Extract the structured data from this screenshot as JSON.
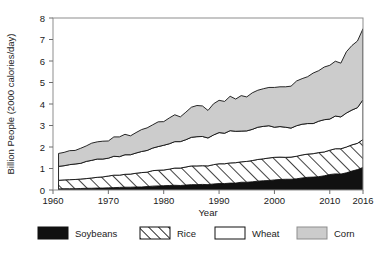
{
  "chart_data": {
    "type": "area",
    "title": "",
    "subtitle": "",
    "xlabel": "Year",
    "ylabel": "Billion People (2000 calories/day)",
    "stacked": true,
    "xlim": [
      1960,
      2016
    ],
    "ylim": [
      0,
      8
    ],
    "xticks": [
      1960,
      1970,
      1980,
      1990,
      2000,
      2010,
      2016
    ],
    "xtick_labels": [
      "1960",
      "1970",
      "1980",
      "1990",
      "2000",
      "2010",
      "2016"
    ],
    "yticks": [
      0,
      1,
      2,
      3,
      4,
      5,
      6,
      7,
      8
    ],
    "ytick_labels": [
      "0",
      "1",
      "2",
      "3",
      "4",
      "5",
      "6",
      "7",
      "8"
    ],
    "grid": false,
    "legend_position": "bottom",
    "legend": [
      "Soybeans",
      "Rice",
      "Wheat",
      "Corn"
    ],
    "colors": {
      "soybeans": "#111111",
      "rice": "#ffffff",
      "rice_hatch": "#111111",
      "wheat": "#ffffff",
      "corn": "#cccccc",
      "outline": "#111111",
      "frame": "#8d8d8d",
      "background": "#ffffff"
    },
    "x": [
      1961,
      1962,
      1963,
      1964,
      1965,
      1966,
      1967,
      1968,
      1969,
      1970,
      1971,
      1972,
      1973,
      1974,
      1975,
      1976,
      1977,
      1978,
      1979,
      1980,
      1981,
      1982,
      1983,
      1984,
      1985,
      1986,
      1987,
      1988,
      1989,
      1990,
      1991,
      1992,
      1993,
      1994,
      1995,
      1996,
      1997,
      1998,
      1999,
      2000,
      2001,
      2002,
      2003,
      2004,
      2005,
      2006,
      2007,
      2008,
      2009,
      2010,
      2011,
      2012,
      2013,
      2014,
      2015,
      2016
    ],
    "series": [
      {
        "name": "Soybeans",
        "values": [
          0.05,
          0.06,
          0.06,
          0.06,
          0.07,
          0.08,
          0.08,
          0.09,
          0.09,
          0.1,
          0.11,
          0.12,
          0.13,
          0.13,
          0.14,
          0.14,
          0.16,
          0.18,
          0.19,
          0.2,
          0.21,
          0.22,
          0.21,
          0.23,
          0.25,
          0.25,
          0.26,
          0.25,
          0.28,
          0.3,
          0.3,
          0.32,
          0.32,
          0.36,
          0.36,
          0.38,
          0.41,
          0.43,
          0.44,
          0.47,
          0.49,
          0.5,
          0.5,
          0.52,
          0.56,
          0.59,
          0.6,
          0.62,
          0.66,
          0.72,
          0.75,
          0.74,
          0.8,
          0.88,
          0.95,
          1.05
        ]
      },
      {
        "name": "Rice",
        "values": [
          0.4,
          0.41,
          0.42,
          0.43,
          0.44,
          0.45,
          0.48,
          0.5,
          0.52,
          0.55,
          0.58,
          0.57,
          0.6,
          0.61,
          0.64,
          0.67,
          0.67,
          0.72,
          0.73,
          0.73,
          0.76,
          0.8,
          0.81,
          0.84,
          0.87,
          0.87,
          0.87,
          0.87,
          0.9,
          0.92,
          0.92,
          0.94,
          0.95,
          0.95,
          0.97,
          0.99,
          1.01,
          1.02,
          1.05,
          1.05,
          1.04,
          1.02,
          1.03,
          1.05,
          1.07,
          1.08,
          1.09,
          1.12,
          1.11,
          1.13,
          1.17,
          1.18,
          1.2,
          1.22,
          1.22,
          1.3
        ]
      },
      {
        "name": "Wheat",
        "values": [
          0.65,
          0.66,
          0.7,
          0.72,
          0.73,
          0.8,
          0.82,
          0.85,
          0.83,
          0.83,
          0.88,
          0.86,
          0.91,
          0.9,
          0.94,
          0.98,
          1.01,
          1.05,
          1.1,
          1.15,
          1.18,
          1.23,
          1.23,
          1.27,
          1.33,
          1.36,
          1.36,
          1.3,
          1.38,
          1.45,
          1.42,
          1.5,
          1.46,
          1.43,
          1.42,
          1.45,
          1.5,
          1.51,
          1.5,
          1.4,
          1.42,
          1.4,
          1.35,
          1.42,
          1.43,
          1.42,
          1.4,
          1.46,
          1.5,
          1.45,
          1.52,
          1.48,
          1.58,
          1.62,
          1.66,
          1.85
        ]
      },
      {
        "name": "Corn",
        "values": [
          0.6,
          0.62,
          0.65,
          0.63,
          0.7,
          0.72,
          0.8,
          0.8,
          0.83,
          0.8,
          0.9,
          0.92,
          0.95,
          0.88,
          0.95,
          1.02,
          1.05,
          1.08,
          1.15,
          1.1,
          1.2,
          1.25,
          1.15,
          1.28,
          1.4,
          1.45,
          1.42,
          1.28,
          1.45,
          1.5,
          1.48,
          1.6,
          1.5,
          1.65,
          1.58,
          1.7,
          1.72,
          1.75,
          1.78,
          1.85,
          1.85,
          1.88,
          1.95,
          2.08,
          2.12,
          2.18,
          2.35,
          2.35,
          2.45,
          2.5,
          2.55,
          2.5,
          2.85,
          3.0,
          3.1,
          3.3
        ]
      }
    ],
    "cumulative_tops_2016": {
      "soybeans": 1.05,
      "rice": 2.35,
      "wheat": 4.2,
      "corn": 7.5
    },
    "cumulative_tops_1961": {
      "soybeans": 0.05,
      "rice": 0.45,
      "wheat": 1.1,
      "corn": 1.7
    }
  },
  "axis": {
    "y_title": "Billion People (2000 calories/day)",
    "x_title": "Year"
  },
  "legend": {
    "items": [
      {
        "label": "Soybeans",
        "swatch": "solid-black-swatch"
      },
      {
        "label": "Rice",
        "swatch": "diagonal-hatch-swatch"
      },
      {
        "label": "Wheat",
        "swatch": "white-swatch"
      },
      {
        "label": "Corn",
        "swatch": "gray-swatch"
      }
    ]
  }
}
